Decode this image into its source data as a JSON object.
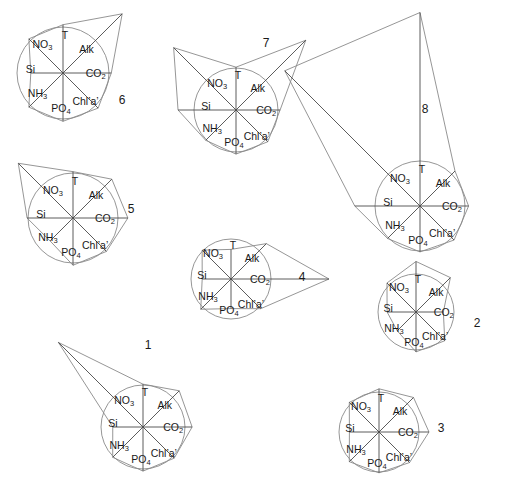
{
  "figure": {
    "width": 506,
    "height": 500,
    "background": "#ffffff",
    "line_color": "#8a8a8a",
    "spoke_color": "#4a4a4a",
    "text_color": "#1a1a1a",
    "type": "star-plot-panel"
  },
  "chart_data": {
    "type": "radar",
    "title": "",
    "xlabel": "",
    "ylabel": "",
    "grid": false,
    "legend_position": "none",
    "axis_order_clockwise_from_top": [
      "T",
      "Alk",
      "CO2",
      "Chl'a'",
      "PO4",
      "NH3",
      "Si",
      "NO3"
    ],
    "axis_labels": {
      "T": "T",
      "Alk": "Alk",
      "CO2": "CO₂",
      "Chla": "Chl’a’",
      "PO4": "PO₄",
      "NH3": "NH₃",
      "Si": "Si",
      "NO3": "NO₃"
    },
    "axis_angles_deg_from_north_clockwise": [
      0,
      45,
      90,
      135,
      180,
      225,
      270,
      315
    ],
    "reference_circle_value": 1.0,
    "series": [
      {
        "name": "1",
        "label": "1",
        "center": [
          143,
          427
        ],
        "radius": 42,
        "number_pos": [
          148,
          349
        ],
        "values": {
          "T": 1.02,
          "Alk": 1.22,
          "CO2": 1.17,
          "Chla": 1.05,
          "PO4": 1.05,
          "NH3": 1.02,
          "Si": 0.72,
          "NO3": 2.85
        }
      },
      {
        "name": "2",
        "label": "2",
        "center": [
          416,
          312
        ],
        "radius": 38,
        "number_pos": [
          477,
          327
        ],
        "values": {
          "T": 1.33,
          "Alk": 1.28,
          "CO2": 0.72,
          "Chla": 1.07,
          "PO4": 1.05,
          "NH3": 0.7,
          "Si": 0.76,
          "NO3": 1.08
        }
      },
      {
        "name": "3",
        "label": "3",
        "center": [
          379,
          432
        ],
        "radius": 40,
        "number_pos": [
          441,
          432
        ],
        "values": {
          "T": 1.08,
          "Alk": 1.22,
          "CO2": 1.25,
          "Chla": 1.08,
          "PO4": 1.02,
          "NH3": 1.05,
          "Si": 0.74,
          "NO3": 1.05
        }
      },
      {
        "name": "4",
        "label": "4",
        "center": [
          231,
          279
        ],
        "radius": 40,
        "number_pos": [
          302,
          281
        ],
        "values": {
          "T": 0.74,
          "Alk": 1.25,
          "CO2": 2.45,
          "Chla": 1.05,
          "PO4": 0.74,
          "NH3": 1.07,
          "Si": 0.72,
          "NO3": 1.02
        }
      },
      {
        "name": "5",
        "label": "5",
        "center": [
          73,
          218
        ],
        "radius": 45,
        "number_pos": [
          131,
          213
        ],
        "values": {
          "T": 1.03,
          "Alk": 1.22,
          "CO2": 1.22,
          "Chla": 1.05,
          "PO4": 1.05,
          "NH3": 0.72,
          "Si": 1.02,
          "NO3": 1.72
        }
      },
      {
        "name": "6",
        "label": "6",
        "center": [
          63,
          73
        ],
        "radius": 46,
        "number_pos": [
          122,
          104
        ],
        "values": {
          "T": 1.05,
          "Alk": 1.82,
          "CO2": 1.05,
          "Chla": 1.08,
          "PO4": 1.05,
          "NH3": 1.05,
          "Si": 0.7,
          "NO3": 1.05
        }
      },
      {
        "name": "7",
        "label": "7",
        "center": [
          236,
          110
        ],
        "radius": 42,
        "number_pos": [
          266,
          47
        ],
        "values": {
          "T": 1.02,
          "Alk": 2.35,
          "CO2": 1.05,
          "Chla": 1.07,
          "PO4": 1.05,
          "NH3": 1.02,
          "Si": 1.38,
          "NO3": 2.1
        }
      },
      {
        "name": "8",
        "label": "8",
        "center": [
          420,
          206
        ],
        "radius": 45,
        "number_pos": [
          425,
          113
        ],
        "values": {
          "T": 4.3,
          "Alk": 1.1,
          "CO2": 1.08,
          "Chla": 1.07,
          "PO4": 1.02,
          "NH3": 1.02,
          "Si": 1.45,
          "NO3": 4.25
        }
      }
    ]
  }
}
